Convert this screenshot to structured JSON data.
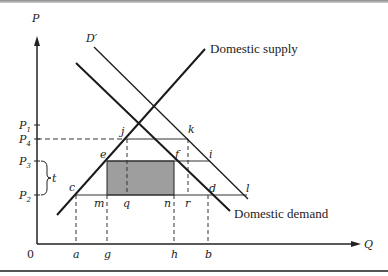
{
  "diagram": {
    "axes": {
      "y_label": "P",
      "x_label": "Q",
      "origin": "0"
    },
    "price_levels": [
      {
        "base": "P",
        "sub": "1",
        "y": 125
      },
      {
        "base": "P",
        "sub": "4",
        "y": 139
      },
      {
        "base": "P",
        "sub": "3",
        "y": 161
      },
      {
        "base": "P",
        "sub": "2",
        "y": 195
      }
    ],
    "quantity_ticks": [
      {
        "label": "a",
        "x": 76
      },
      {
        "label": "g",
        "x": 107
      },
      {
        "label": "h",
        "x": 174
      },
      {
        "label": "b",
        "x": 208
      }
    ],
    "tariff_label": "t",
    "curves": {
      "supply": "Domestic supply",
      "demand": "Domestic demand",
      "shifted_demand": "D′"
    },
    "points": {
      "j": "j",
      "k": "k",
      "e": "e",
      "f": "f",
      "i": "i",
      "c": "c",
      "m": "m",
      "q": "q",
      "n": "n",
      "r": "r",
      "d": "d",
      "l": "l"
    },
    "colors": {
      "line": "#1a1a1a",
      "shaded_area": "#9e9e9e"
    }
  }
}
